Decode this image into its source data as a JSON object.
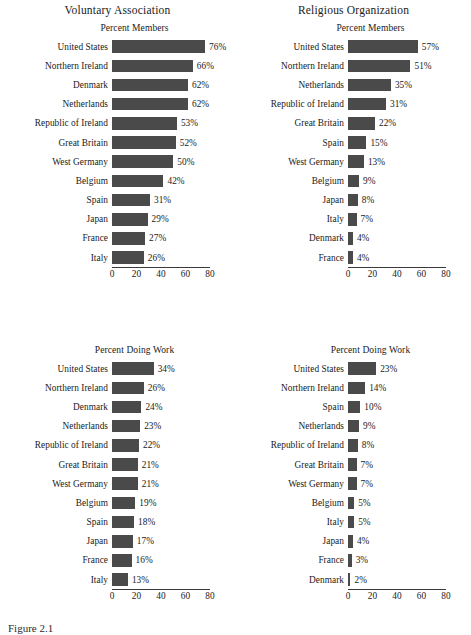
{
  "chart_data": [
    {
      "type": "bar",
      "title": "Voluntary Association",
      "subtitle": "Percent Members",
      "orientation": "horizontal",
      "xlabel": "",
      "ylabel": "",
      "xlim": [
        0,
        80
      ],
      "xticks": [
        0,
        20,
        40,
        60,
        80
      ],
      "grid": false,
      "legend": "none",
      "bar_color": "#4a4a4a",
      "categories": [
        "United States",
        "Northern Ireland",
        "Denmark",
        "Netherlands",
        "Republic of Ireland",
        "Great Britain",
        "West Germany",
        "Belgium",
        "Spain",
        "Japan",
        "France",
        "Italy"
      ],
      "values": [
        76,
        66,
        62,
        62,
        53,
        52,
        50,
        42,
        31,
        29,
        27,
        26
      ],
      "value_labels": [
        "76%",
        "66%",
        "62%",
        "62%",
        "53%",
        "52%",
        "50%",
        "42%",
        "31%",
        "29%",
        "27%",
        "26%"
      ]
    },
    {
      "type": "bar",
      "title": "Religious Organization",
      "subtitle": "Percent Members",
      "orientation": "horizontal",
      "xlabel": "",
      "ylabel": "",
      "xlim": [
        0,
        80
      ],
      "xticks": [
        0,
        20,
        40,
        60,
        80
      ],
      "grid": false,
      "legend": "none",
      "bar_color": "#4a4a4a",
      "categories": [
        "United States",
        "Northern Ireland",
        "Netherlands",
        "Republic of Ireland",
        "Great Britain",
        "Spain",
        "West Germany",
        "Belgium",
        "Japan",
        "Italy",
        "Denmark",
        "France"
      ],
      "values": [
        57,
        51,
        35,
        31,
        22,
        15,
        13,
        9,
        8,
        7,
        4,
        4
      ],
      "value_labels": [
        "57%",
        "51%",
        "35%",
        "31%",
        "22%",
        "15%",
        "13%",
        "9%",
        "8%",
        "7%",
        "4%",
        "4%"
      ]
    },
    {
      "type": "bar",
      "title": "",
      "subtitle": "Percent Doing Work",
      "orientation": "horizontal",
      "xlabel": "",
      "ylabel": "",
      "xlim": [
        0,
        80
      ],
      "xticks": [
        0,
        20,
        40,
        60,
        80
      ],
      "grid": false,
      "legend": "none",
      "bar_color": "#4a4a4a",
      "categories": [
        "United States",
        "Northern Ireland",
        "Denmark",
        "Netherlands",
        "Republic of Ireland",
        "Great Britain",
        "West Germany",
        "Belgium",
        "Spain",
        "Japan",
        "France",
        "Italy"
      ],
      "values": [
        34,
        26,
        24,
        23,
        22,
        21,
        21,
        19,
        18,
        17,
        16,
        13
      ],
      "value_labels": [
        "34%",
        "26%",
        "24%",
        "23%",
        "22%",
        "21%",
        "21%",
        "19%",
        "18%",
        "17%",
        "16%",
        "13%"
      ]
    },
    {
      "type": "bar",
      "title": "",
      "subtitle": "Percent Doing Work",
      "orientation": "horizontal",
      "xlabel": "",
      "ylabel": "",
      "xlim": [
        0,
        80
      ],
      "xticks": [
        0,
        20,
        40,
        60,
        80
      ],
      "grid": false,
      "legend": "none",
      "bar_color": "#4a4a4a",
      "categories": [
        "United States",
        "Northern Ireland",
        "Spain",
        "Netherlands",
        "Republic of Ireland",
        "Great Britain",
        "West Germany",
        "Belgium",
        "Italy",
        "Japan",
        "France",
        "Denmark"
      ],
      "values": [
        23,
        14,
        10,
        9,
        8,
        7,
        7,
        5,
        5,
        4,
        3,
        2
      ],
      "value_labels": [
        "23%",
        "14%",
        "10%",
        "9%",
        "8%",
        "7%",
        "7%",
        "5%",
        "5%",
        "4%",
        "3%",
        "2%"
      ]
    }
  ],
  "caption": "Figure 2.1"
}
